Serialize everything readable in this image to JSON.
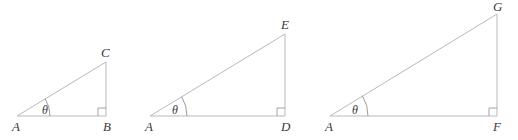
{
  "figure": {
    "type": "geometry-diagram",
    "background_color": "#ffffff",
    "line_color": "#b9b9b9",
    "label_color": "#3a3a3a",
    "angle_symbol": "θ",
    "triangles": [
      {
        "name": "triangle-abc",
        "angle_label": "θ",
        "vertices": [
          {
            "label": "A",
            "role": "angle-vertex",
            "x": 17,
            "y": 116
          },
          {
            "label": "B",
            "role": "right-angle-vertex",
            "x": 106,
            "y": 116
          },
          {
            "label": "C",
            "role": "apex",
            "x": 106,
            "y": 62
          }
        ],
        "base_length": 89,
        "height": 54,
        "right_angle_at": "B"
      },
      {
        "name": "triangle-ade",
        "angle_label": "θ",
        "vertices": [
          {
            "label": "A",
            "role": "angle-vertex",
            "x": 150,
            "y": 116
          },
          {
            "label": "D",
            "role": "right-angle-vertex",
            "x": 285,
            "y": 116
          },
          {
            "label": "E",
            "role": "apex",
            "x": 285,
            "y": 34
          }
        ],
        "base_length": 135,
        "height": 82,
        "right_angle_at": "D"
      },
      {
        "name": "triangle-afg",
        "angle_label": "θ",
        "vertices": [
          {
            "label": "A",
            "role": "angle-vertex",
            "x": 330,
            "y": 116
          },
          {
            "label": "F",
            "role": "right-angle-vertex",
            "x": 497,
            "y": 116
          },
          {
            "label": "G",
            "role": "apex",
            "x": 497,
            "y": 14
          }
        ],
        "base_length": 167,
        "height": 102,
        "right_angle_at": "F"
      }
    ]
  },
  "labels": {
    "t1_A": "A",
    "t1_B": "B",
    "t1_C": "C",
    "t1_theta": "θ",
    "t2_A": "A",
    "t2_D": "D",
    "t2_E": "E",
    "t2_theta": "θ",
    "t3_A": "A",
    "t3_F": "F",
    "t3_G": "G",
    "t3_theta": "θ"
  }
}
